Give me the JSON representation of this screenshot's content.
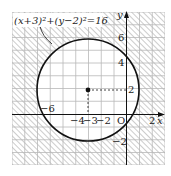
{
  "figure": {
    "type": "coordinate-plane-circle",
    "equation_label": "(x+3)²+(y−2)²=16",
    "center": {
      "x": -3,
      "y": 2
    },
    "radius": 4,
    "axis_labels": {
      "x": "x",
      "y": "y",
      "origin": "O"
    },
    "x_ticks": [
      {
        "value": -6,
        "label": "−6"
      },
      {
        "value": -4,
        "label": "−4"
      },
      {
        "value": -3,
        "label": "−3"
      },
      {
        "value": -2,
        "label": "−2"
      },
      {
        "value": 2,
        "label": "2"
      }
    ],
    "y_ticks": [
      {
        "value": 6,
        "label": "6"
      },
      {
        "value": 4,
        "label": "4"
      },
      {
        "value": 2,
        "label": "2"
      },
      {
        "value": -2,
        "label": "−2"
      }
    ],
    "region_note": "Hatched region lies outside the circle; the interior of the circle is unshaded",
    "colors": {
      "grid": "#b8b8b8",
      "hatch": "#9a9a9a",
      "curve": "#111111",
      "axis": "#111111"
    }
  }
}
